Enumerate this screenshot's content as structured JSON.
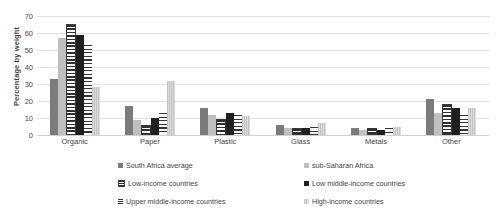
{
  "chart_data": {
    "type": "bar",
    "title": "",
    "subtitle": "",
    "xlabel": "",
    "ylabel": "Percentage by weight",
    "ylim": [
      0,
      70
    ],
    "ytick_step": 10,
    "yticks": [
      "70",
      "60",
      "50",
      "40",
      "30",
      "20",
      "10",
      "0"
    ],
    "grid": true,
    "legend_position": "bottom",
    "categories": [
      "Organic",
      "Paper",
      "Plastic",
      "Glass",
      "Metals",
      "Other"
    ],
    "series": [
      {
        "name": "South Africa average",
        "swatch": "solid-dark-grey",
        "color": "#7b7b7b",
        "values": [
          33,
          17,
          16,
          6,
          4,
          21
        ]
      },
      {
        "name": "sub-Saharan Africa",
        "swatch": "solid-light-grey",
        "color": "#bfbfbf",
        "values": [
          57,
          9,
          12,
          4,
          3,
          13
        ]
      },
      {
        "name": "Low-income countries",
        "swatch": "hatched-horizontal-bars",
        "color": "#2f2f2f",
        "values": [
          64,
          5,
          8,
          3,
          3,
          17
        ]
      },
      {
        "name": "Low middle-income countries",
        "swatch": "solid-black",
        "color": "#1f1f1f",
        "values": [
          59,
          10,
          13,
          4,
          3,
          16
        ]
      },
      {
        "name": "Upper middle-income countries",
        "swatch": "thin-horizontal-lines",
        "color": "#353535",
        "values": [
          53,
          13,
          12,
          5,
          4,
          12
        ]
      },
      {
        "name": "High-income countries",
        "swatch": "light-speckle",
        "color": "#d2d2d2",
        "values": [
          28,
          32,
          11,
          7,
          5,
          16
        ]
      }
    ]
  }
}
